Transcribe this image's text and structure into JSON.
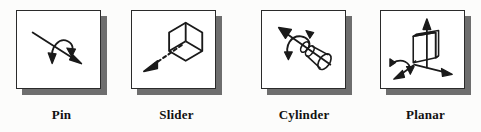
{
  "figure": {
    "background_color": "#fcfcfb",
    "ink_color": "#1a1a1a",
    "shadow_color": "#6e6e6e",
    "card_color": "#ffffff"
  },
  "panels": [
    {
      "id": "pin",
      "label": "Pin",
      "icon": "pin-joint-icon",
      "description": "Straight arrow pointing down-right with a curved rotation arrow looping about it",
      "degrees_of_freedom": 1,
      "motion": "rotation",
      "elements": [
        "translation-axis-arrow",
        "rotation-curved-arrow"
      ]
    },
    {
      "id": "slider",
      "label": "Slider",
      "icon": "slider-joint-icon",
      "description": "Isometric hexagonal cube with a dashed arrow pointing down-left",
      "degrees_of_freedom": 1,
      "motion": "translation",
      "elements": [
        "isometric-cube",
        "dashed-translation-arrow"
      ]
    },
    {
      "id": "cylinder",
      "label": "Cylinder",
      "icon": "cylinder-joint-icon",
      "description": "Cylinder on an inclined axis with an arrow pointing up-left and a curved rotation arrow",
      "degrees_of_freedom": 2,
      "motion": "rotation and translation",
      "elements": [
        "cylinder-body",
        "translation-axis-arrow",
        "rotation-curved-arrow"
      ]
    },
    {
      "id": "planar",
      "label": "Planar",
      "icon": "planar-joint-icon",
      "description": "Rectangular plate in isometric view with three axis arrows and a curved rotation arrow",
      "degrees_of_freedom": 3,
      "motion": "two translations and one rotation",
      "elements": [
        "plate-slab",
        "vertical-axis-arrow",
        "right-axis-arrow",
        "left-axis-arrow",
        "rotation-curved-arrow"
      ]
    }
  ]
}
